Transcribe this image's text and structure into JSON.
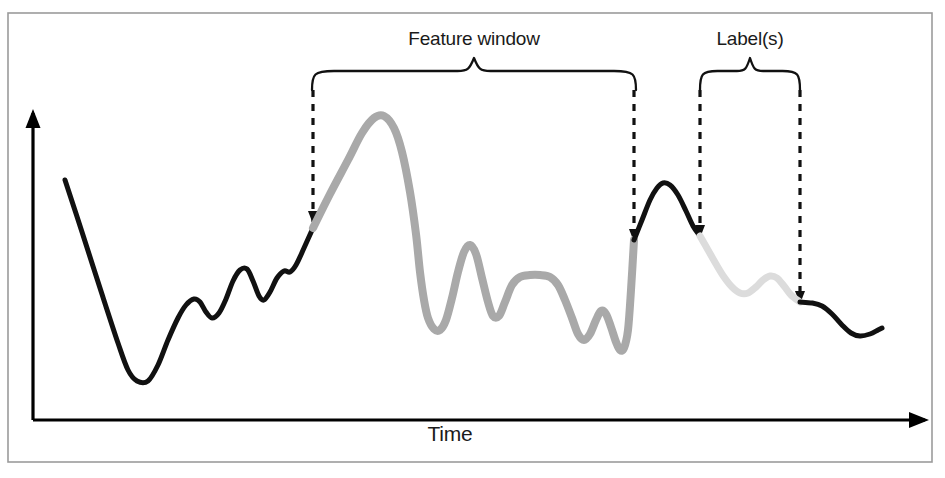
{
  "figure": {
    "background_color": "#ffffff",
    "frame": {
      "x": 8,
      "y": 13,
      "width": 924,
      "height": 449,
      "stroke": "#9b9b9b",
      "stroke_width": 1.6
    },
    "caption_top_partial": "",
    "caption_bottom_partial": ""
  },
  "labels": {
    "feature_window": "Feature window",
    "labels_bracket": "Label(s)",
    "time_axis": "Time"
  },
  "axes": {
    "y_axis": {
      "x": 33,
      "y_top": 113,
      "y_bottom": 420,
      "arrow": "up-arrowhead",
      "color": "#000000"
    },
    "x_axis": {
      "y": 420,
      "x_left": 33,
      "x_right": 925,
      "arrow": "right-arrowhead",
      "color": "#000000"
    }
  },
  "colors": {
    "line_black": "#111111",
    "line_gray_feature": "#a9a9a9",
    "line_gray_label": "#dcdcdc",
    "frame_border": "#9b9b9b",
    "text": "#1a1a1a",
    "dashed": "#111111"
  },
  "braces": [
    {
      "name": "feature-window-brace",
      "x_start": 312,
      "x_end": 636,
      "peak_x": 474,
      "top_y": 58,
      "bottom_y": 90
    },
    {
      "name": "labels-brace",
      "x_start": 700,
      "x_end": 800,
      "peak_x": 750,
      "top_y": 58,
      "bottom_y": 90
    }
  ],
  "dashed_guides": [
    {
      "name": "feature-window-start-guide",
      "x": 313,
      "y_top": 90,
      "y_bottom": 222
    },
    {
      "name": "feature-window-end-guide",
      "x": 634,
      "y_top": 90,
      "y_bottom": 240
    },
    {
      "name": "labels-start-guide",
      "x": 700,
      "y_top": 90,
      "y_bottom": 236
    },
    {
      "name": "labels-end-guide",
      "x": 800,
      "y_top": 90,
      "y_bottom": 302
    }
  ],
  "chart_data": {
    "type": "line",
    "title": "",
    "subtitle": "",
    "xlabel": "Time",
    "ylabel": "",
    "grid": false,
    "legend": null,
    "axis_ranges": {
      "x": [
        33,
        925
      ],
      "y": [
        113,
        420
      ]
    },
    "annotations": [
      {
        "text": "Feature window",
        "x_range": [
          313,
          634
        ],
        "marker": "curly-brace"
      },
      {
        "text": "Label(s)",
        "x_range": [
          700,
          800
        ],
        "marker": "curly-brace"
      }
    ],
    "segments": [
      {
        "name": "history",
        "color": "#111111",
        "stroke_width": 5,
        "x_range": [
          65,
          313
        ],
        "points": [
          [
            65,
            180
          ],
          [
            82,
            232
          ],
          [
            100,
            288
          ],
          [
            118,
            343
          ],
          [
            128,
            370
          ],
          [
            137,
            381
          ],
          [
            148,
            381
          ],
          [
            158,
            365
          ],
          [
            168,
            340
          ],
          [
            178,
            318
          ],
          [
            186,
            305
          ],
          [
            194,
            299
          ],
          [
            200,
            302
          ],
          [
            206,
            312
          ],
          [
            212,
            318
          ],
          [
            219,
            313
          ],
          [
            226,
            299
          ],
          [
            233,
            281
          ],
          [
            240,
            270
          ],
          [
            247,
            269
          ],
          [
            253,
            281
          ],
          [
            259,
            296
          ],
          [
            264,
            300
          ],
          [
            270,
            292
          ],
          [
            277,
            278
          ],
          [
            284,
            271
          ],
          [
            290,
            272
          ],
          [
            296,
            265
          ],
          [
            304,
            248
          ],
          [
            313,
            228
          ]
        ]
      },
      {
        "name": "feature-window",
        "color": "#a9a9a9",
        "stroke_width": 8,
        "x_range": [
          313,
          634
        ],
        "points": [
          [
            313,
            228
          ],
          [
            330,
            194
          ],
          [
            348,
            160
          ],
          [
            362,
            133
          ],
          [
            374,
            118
          ],
          [
            384,
            116
          ],
          [
            394,
            128
          ],
          [
            402,
            152
          ],
          [
            410,
            192
          ],
          [
            416,
            234
          ],
          [
            420,
            272
          ],
          [
            424,
            300
          ],
          [
            428,
            318
          ],
          [
            434,
            329
          ],
          [
            440,
            330
          ],
          [
            446,
            320
          ],
          [
            452,
            298
          ],
          [
            458,
            272
          ],
          [
            464,
            252
          ],
          [
            470,
            245
          ],
          [
            476,
            254
          ],
          [
            482,
            278
          ],
          [
            488,
            302
          ],
          [
            493,
            316
          ],
          [
            499,
            316
          ],
          [
            505,
            302
          ],
          [
            512,
            285
          ],
          [
            520,
            277
          ],
          [
            530,
            275
          ],
          [
            540,
            275
          ],
          [
            550,
            277
          ],
          [
            558,
            285
          ],
          [
            565,
            300
          ],
          [
            572,
            318
          ],
          [
            578,
            334
          ],
          [
            584,
            340
          ],
          [
            590,
            334
          ],
          [
            596,
            320
          ],
          [
            601,
            311
          ],
          [
            606,
            314
          ],
          [
            611,
            327
          ],
          [
            616,
            342
          ],
          [
            620,
            350
          ],
          [
            624,
            348
          ],
          [
            628,
            330
          ],
          [
            631,
            290
          ],
          [
            634,
            240
          ]
        ]
      },
      {
        "name": "gap",
        "color": "#111111",
        "stroke_width": 5,
        "x_range": [
          634,
          700
        ],
        "points": [
          [
            634,
            240
          ],
          [
            642,
            220
          ],
          [
            650,
            200
          ],
          [
            657,
            188
          ],
          [
            663,
            183
          ],
          [
            670,
            185
          ],
          [
            678,
            195
          ],
          [
            686,
            211
          ],
          [
            693,
            226
          ],
          [
            700,
            236
          ]
        ]
      },
      {
        "name": "label-window",
        "color": "#dcdcdc",
        "stroke_width": 7,
        "x_range": [
          700,
          800
        ],
        "points": [
          [
            700,
            236
          ],
          [
            708,
            250
          ],
          [
            716,
            264
          ],
          [
            724,
            277
          ],
          [
            732,
            287
          ],
          [
            740,
            293
          ],
          [
            748,
            293
          ],
          [
            756,
            287
          ],
          [
            763,
            280
          ],
          [
            770,
            276
          ],
          [
            777,
            278
          ],
          [
            784,
            286
          ],
          [
            791,
            295
          ],
          [
            800,
            302
          ]
        ]
      },
      {
        "name": "future",
        "color": "#111111",
        "stroke_width": 5,
        "x_range": [
          800,
          882
        ],
        "points": [
          [
            800,
            302
          ],
          [
            812,
            303
          ],
          [
            822,
            306
          ],
          [
            832,
            314
          ],
          [
            842,
            325
          ],
          [
            851,
            333
          ],
          [
            860,
            336
          ],
          [
            870,
            334
          ],
          [
            878,
            330
          ],
          [
            882,
            328
          ]
        ]
      }
    ]
  }
}
